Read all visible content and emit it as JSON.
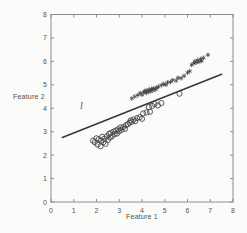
{
  "figure": {
    "background": "#fbfbf9",
    "axis_color": "#8c8c8c",
    "tick_label_color": "#555555",
    "marker_color": "#3e3e3e",
    "line_color": "#383838"
  },
  "chart_data": {
    "type": "scatter",
    "title": "",
    "xlabel": "Feature 1",
    "ylabel": "Feature 2",
    "xlim": [
      0,
      8
    ],
    "ylim": [
      0,
      8
    ],
    "x_ticks": [
      0,
      1,
      2,
      3,
      4,
      5,
      6,
      7,
      8
    ],
    "y_ticks": [
      0,
      1,
      2,
      3,
      4,
      5,
      6,
      7,
      8
    ],
    "grid": false,
    "legend_position": "none",
    "box": true,
    "series": [
      {
        "name": "class-1-asterisks",
        "marker": "asterisk",
        "color": "#3e3e3e",
        "points": [
          [
            3.55,
            4.42
          ],
          [
            3.68,
            4.5
          ],
          [
            3.82,
            4.56
          ],
          [
            3.92,
            4.65
          ],
          [
            4.0,
            4.58
          ],
          [
            4.08,
            4.68
          ],
          [
            4.12,
            4.74
          ],
          [
            4.18,
            4.65
          ],
          [
            4.22,
            4.76
          ],
          [
            4.28,
            4.7
          ],
          [
            4.32,
            4.8
          ],
          [
            4.38,
            4.72
          ],
          [
            4.42,
            4.82
          ],
          [
            4.48,
            4.76
          ],
          [
            4.52,
            4.85
          ],
          [
            4.6,
            4.8
          ],
          [
            4.65,
            4.88
          ],
          [
            4.72,
            4.92
          ],
          [
            4.85,
            4.98
          ],
          [
            4.95,
            5.04
          ],
          [
            5.05,
            5.0
          ],
          [
            5.12,
            5.1
          ],
          [
            5.25,
            5.12
          ],
          [
            5.35,
            5.2
          ],
          [
            5.5,
            5.18
          ],
          [
            5.58,
            5.3
          ],
          [
            5.72,
            5.28
          ],
          [
            5.85,
            5.38
          ],
          [
            6.0,
            5.52
          ],
          [
            6.1,
            5.58
          ],
          [
            6.18,
            5.85
          ],
          [
            6.28,
            5.92
          ],
          [
            6.32,
            6.0
          ],
          [
            6.38,
            5.95
          ],
          [
            6.45,
            6.05
          ],
          [
            6.5,
            5.98
          ],
          [
            6.58,
            6.1
          ],
          [
            6.62,
            6.02
          ],
          [
            6.7,
            6.15
          ],
          [
            6.9,
            6.28
          ]
        ]
      },
      {
        "name": "class-2-circles",
        "marker": "circle",
        "color": "#474747",
        "points": [
          [
            1.85,
            2.62
          ],
          [
            1.92,
            2.55
          ],
          [
            2.0,
            2.72
          ],
          [
            2.05,
            2.45
          ],
          [
            2.1,
            2.68
          ],
          [
            2.18,
            2.38
          ],
          [
            2.2,
            2.62
          ],
          [
            2.25,
            2.78
          ],
          [
            2.3,
            2.55
          ],
          [
            2.35,
            2.7
          ],
          [
            2.4,
            2.48
          ],
          [
            2.45,
            2.8
          ],
          [
            2.5,
            2.65
          ],
          [
            2.55,
            2.9
          ],
          [
            2.6,
            2.75
          ],
          [
            2.62,
            2.95
          ],
          [
            2.7,
            2.82
          ],
          [
            2.75,
            3.0
          ],
          [
            2.8,
            2.9
          ],
          [
            2.85,
            3.05
          ],
          [
            2.9,
            2.92
          ],
          [
            2.95,
            3.1
          ],
          [
            3.0,
            3.02
          ],
          [
            3.05,
            3.18
          ],
          [
            3.1,
            3.08
          ],
          [
            3.18,
            3.2
          ],
          [
            3.25,
            3.12
          ],
          [
            3.3,
            3.28
          ],
          [
            3.38,
            3.32
          ],
          [
            3.45,
            3.38
          ],
          [
            3.5,
            3.48
          ],
          [
            3.55,
            3.42
          ],
          [
            3.62,
            3.52
          ],
          [
            3.7,
            3.45
          ],
          [
            3.78,
            3.58
          ],
          [
            3.9,
            3.62
          ],
          [
            4.0,
            3.55
          ],
          [
            4.05,
            3.78
          ],
          [
            4.2,
            3.82
          ],
          [
            4.3,
            4.05
          ],
          [
            4.35,
            3.85
          ],
          [
            4.45,
            4.1
          ],
          [
            4.55,
            4.18
          ],
          [
            4.7,
            4.12
          ],
          [
            4.85,
            4.22
          ],
          [
            5.65,
            4.62
          ]
        ]
      }
    ],
    "boundary_line": {
      "x1": 0.5,
      "y1": 2.75,
      "x2": 7.5,
      "y2": 5.45,
      "color": "#383838"
    },
    "annotations": [
      {
        "text": "l",
        "x": 1.35,
        "y": 3.95,
        "style": "italic"
      }
    ]
  }
}
